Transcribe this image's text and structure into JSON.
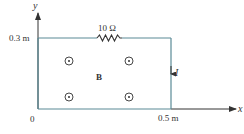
{
  "diagram": {
    "colors": {
      "wire": "#5a8a96",
      "axis": "#333333",
      "text": "#333333",
      "background": "#ffffff"
    },
    "axes": {
      "y_label": "y",
      "x_label": "x",
      "origin_label": "0",
      "y_tick_label": "0.3 m",
      "x_tick_label": "0.5 m"
    },
    "circuit": {
      "resistor_label": "10 Ω",
      "current_label": "I",
      "current_direction": "down"
    },
    "field": {
      "label": "B",
      "direction": "out-of-page",
      "symbol_count": 4
    }
  }
}
